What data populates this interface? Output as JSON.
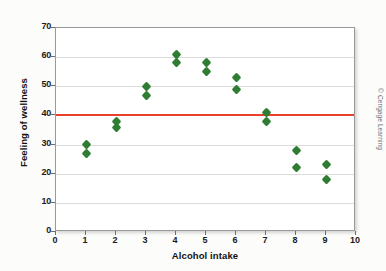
{
  "chart_data": {
    "type": "scatter",
    "title": "",
    "xlabel": "Alcohol intake",
    "ylabel": "Feeling of wellness",
    "xlim": [
      0,
      10
    ],
    "ylim": [
      0,
      70
    ],
    "xticks": [
      0,
      1,
      2,
      3,
      4,
      5,
      6,
      7,
      8,
      9,
      10
    ],
    "yticks": [
      0,
      10,
      20,
      30,
      40,
      50,
      60,
      70
    ],
    "grid": "horizontal",
    "legend": "none",
    "marker": {
      "shape": "diamond",
      "color": "#2f7d32",
      "size": 7
    },
    "reference_line": {
      "orientation": "horizontal",
      "y": 40,
      "color": "#e8402a",
      "label": ""
    },
    "points": [
      {
        "x": 1,
        "y": 30
      },
      {
        "x": 1,
        "y": 27
      },
      {
        "x": 2,
        "y": 38
      },
      {
        "x": 2,
        "y": 36
      },
      {
        "x": 3,
        "y": 50
      },
      {
        "x": 3,
        "y": 47
      },
      {
        "x": 4,
        "y": 61
      },
      {
        "x": 4,
        "y": 58
      },
      {
        "x": 5,
        "y": 58
      },
      {
        "x": 5,
        "y": 55
      },
      {
        "x": 6,
        "y": 53
      },
      {
        "x": 6,
        "y": 49
      },
      {
        "x": 7,
        "y": 41
      },
      {
        "x": 7,
        "y": 38
      },
      {
        "x": 8,
        "y": 28
      },
      {
        "x": 8,
        "y": 22
      },
      {
        "x": 9,
        "y": 23
      },
      {
        "x": 9,
        "y": 18
      }
    ]
  },
  "credit": {
    "text": "© Cengage Learning"
  }
}
